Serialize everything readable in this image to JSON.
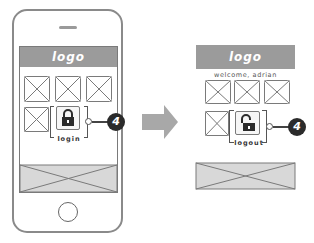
{
  "diagram": {
    "before": {
      "header_logo": "logo",
      "action_label": "login",
      "lock_state": "locked",
      "annotation_badge": "4"
    },
    "after": {
      "header_logo": "logo",
      "welcome_text": "welcome, adrian",
      "action_label": "logout",
      "lock_state": "unlocked",
      "annotation_badge": "4"
    },
    "transition_icon": "arrow-right-icon",
    "colors": {
      "header": "#9b9b9b",
      "footer": "#d8d8d8",
      "badge": "#2b2b2b",
      "arrow": "#a8a8a8",
      "outline": "#7a7a7a"
    }
  }
}
